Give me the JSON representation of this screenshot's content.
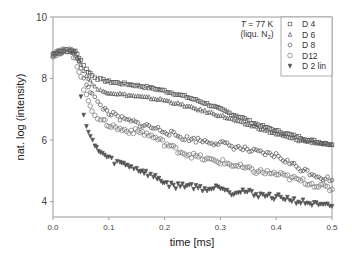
{
  "chart_data": {
    "type": "scatter",
    "title": "",
    "xlabel": "time  [ms]",
    "ylabel": "nat. log (intensity)",
    "xlim": [
      0.0,
      0.5
    ],
    "ylim": [
      3.5,
      10
    ],
    "xticks": [
      0.0,
      0.1,
      0.2,
      0.3,
      0.4,
      0.5
    ],
    "xtick_labels": [
      "0.0",
      "0.1",
      "0.2",
      "0.3",
      "0.4",
      "0.5"
    ],
    "yticks": [
      4,
      6,
      8,
      10
    ],
    "ytick_labels": [
      "4",
      "6",
      "8",
      "10"
    ],
    "grid": false,
    "legend_position": "upper right (inside)",
    "annotation": {
      "line1_italic": "T",
      "line1_rest": " = 77 K",
      "line2": "(liqu. N",
      "line2_sub": "2",
      "line2_end": ")"
    },
    "series": [
      {
        "name": "D 4",
        "marker": "square",
        "x": [
          0.0,
          0.01,
          0.02,
          0.03,
          0.04,
          0.05,
          0.06,
          0.07,
          0.08,
          0.09,
          0.1,
          0.12,
          0.14,
          0.16,
          0.18,
          0.2,
          0.22,
          0.24,
          0.26,
          0.28,
          0.3,
          0.32,
          0.34,
          0.36,
          0.38,
          0.4,
          0.42,
          0.44,
          0.46,
          0.48,
          0.5
        ],
        "y": [
          8.8,
          8.88,
          8.92,
          8.92,
          8.88,
          8.6,
          8.3,
          8.1,
          8.0,
          7.95,
          7.9,
          7.85,
          7.8,
          7.75,
          7.68,
          7.6,
          7.5,
          7.4,
          7.28,
          7.15,
          7.0,
          6.85,
          6.72,
          6.55,
          6.42,
          6.3,
          6.2,
          6.1,
          6.0,
          5.92,
          5.85
        ]
      },
      {
        "name": "D 6",
        "marker": "triangle-up",
        "x": [
          0.0,
          0.01,
          0.02,
          0.03,
          0.04,
          0.05,
          0.06,
          0.07,
          0.08,
          0.09,
          0.1,
          0.12,
          0.14,
          0.16,
          0.18,
          0.2,
          0.22,
          0.24,
          0.26,
          0.28,
          0.3,
          0.32,
          0.34,
          0.36,
          0.38,
          0.4,
          0.42,
          0.44,
          0.46,
          0.48,
          0.5
        ],
        "y": [
          8.78,
          8.85,
          8.9,
          8.9,
          8.85,
          8.45,
          8.1,
          7.85,
          7.65,
          7.58,
          7.55,
          7.5,
          7.45,
          7.4,
          7.35,
          7.3,
          7.2,
          7.1,
          7.0,
          6.9,
          6.8,
          6.68,
          6.55,
          6.45,
          6.32,
          6.2,
          6.1,
          6.0,
          5.95,
          5.9,
          5.85
        ]
      },
      {
        "name": "D 8",
        "marker": "circle",
        "x": [
          0.0,
          0.01,
          0.02,
          0.03,
          0.04,
          0.05,
          0.06,
          0.07,
          0.08,
          0.09,
          0.1,
          0.12,
          0.14,
          0.16,
          0.18,
          0.2,
          0.22,
          0.24,
          0.26,
          0.28,
          0.3,
          0.32,
          0.34,
          0.36,
          0.38,
          0.4,
          0.42,
          0.44,
          0.46,
          0.48,
          0.5
        ],
        "y": [
          8.8,
          8.86,
          8.9,
          8.9,
          8.8,
          8.3,
          7.85,
          7.5,
          7.2,
          7.05,
          6.9,
          6.7,
          6.6,
          6.5,
          6.4,
          6.3,
          6.15,
          6.05,
          6.0,
          5.95,
          5.9,
          5.8,
          5.72,
          5.62,
          5.55,
          5.5,
          5.3,
          5.1,
          4.95,
          4.8,
          4.7
        ]
      },
      {
        "name": "D12",
        "marker": "circle-open",
        "x": [
          0.0,
          0.01,
          0.02,
          0.03,
          0.04,
          0.05,
          0.06,
          0.07,
          0.08,
          0.09,
          0.1,
          0.12,
          0.14,
          0.16,
          0.18,
          0.2,
          0.22,
          0.24,
          0.26,
          0.28,
          0.3,
          0.32,
          0.34,
          0.36,
          0.38,
          0.4,
          0.42,
          0.44,
          0.46,
          0.48,
          0.5
        ],
        "y": [
          8.78,
          8.84,
          8.88,
          8.88,
          8.7,
          8.0,
          7.4,
          7.0,
          6.75,
          6.6,
          6.5,
          6.35,
          6.3,
          6.25,
          6.1,
          5.9,
          5.7,
          5.55,
          5.45,
          5.35,
          5.3,
          5.2,
          5.1,
          5.0,
          4.95,
          4.9,
          4.8,
          4.7,
          4.6,
          4.5,
          4.4
        ]
      },
      {
        "name": "D 2 lin",
        "marker": "triangle-down",
        "x": [
          0.05,
          0.055,
          0.06,
          0.067,
          0.075,
          0.085,
          0.1,
          0.11,
          0.12,
          0.13,
          0.14,
          0.15,
          0.16,
          0.17,
          0.18,
          0.19,
          0.2,
          0.22,
          0.24,
          0.26,
          0.28,
          0.3,
          0.32,
          0.34,
          0.36,
          0.38,
          0.4,
          0.42,
          0.44,
          0.46,
          0.48,
          0.5
        ],
        "y": [
          7.4,
          6.9,
          6.45,
          6.1,
          5.8,
          5.6,
          5.4,
          5.3,
          5.25,
          5.2,
          5.15,
          5.05,
          5.0,
          4.9,
          4.8,
          4.75,
          4.6,
          4.5,
          4.55,
          4.45,
          4.4,
          4.5,
          4.3,
          4.35,
          4.25,
          4.2,
          4.15,
          4.1,
          4.0,
          3.95,
          3.85,
          3.85
        ]
      }
    ]
  },
  "legend": {
    "items": [
      {
        "label": "D 4",
        "marker": "square"
      },
      {
        "label": "D 6",
        "marker": "triangle-up"
      },
      {
        "label": "D 8",
        "marker": "circle"
      },
      {
        "label": "D12",
        "marker": "circle-open"
      },
      {
        "label": "D 2 lin",
        "marker": "triangle-down"
      }
    ]
  },
  "colors": {
    "marker": "#555555",
    "axis": "#999999",
    "text": "#333333"
  }
}
